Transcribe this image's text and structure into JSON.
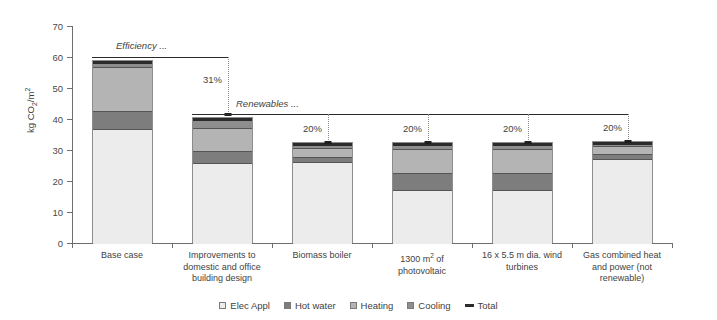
{
  "chart_data": {
    "type": "bar",
    "subtype": "stacked-bar",
    "title": "",
    "xlabel": "",
    "ylabel": "kg CO2/m2",
    "ylabel_parts": {
      "prefix": "kg CO",
      "sub": "2",
      "suffix": "/m",
      "sup": "2"
    },
    "ylim": [
      0,
      70
    ],
    "ytick_step": 10,
    "yticks": [
      "70",
      "60",
      "50",
      "40",
      "30",
      "20",
      "10",
      "0"
    ],
    "grid": false,
    "legend_position": "bottom",
    "categories": [
      "Base case",
      "Improvements to domestic and office building design",
      "Biomass boiler",
      "1300 m2 of photovoltaic",
      "16 x 5.5 m dia. wind turbines",
      "Gas combined heat and power (not renewable)"
    ],
    "series": [
      {
        "name": "Elec Appl",
        "color": "#ececec",
        "values": [
          37.0,
          26.0,
          26.5,
          17.5,
          17.5,
          27.5
        ]
      },
      {
        "name": "Hot water",
        "color": "#7d7d7d",
        "values": [
          6.0,
          4.0,
          1.5,
          5.5,
          5.5,
          1.5
        ]
      },
      {
        "name": "Heating",
        "color": "#b4b4b4",
        "values": [
          14.0,
          7.5,
          3.0,
          7.5,
          7.5,
          2.5
        ]
      },
      {
        "name": "Cooling",
        "color": "#8e8e8e",
        "values": [
          2.0,
          3.0,
          1.5,
          2.0,
          2.0,
          1.5
        ]
      },
      {
        "name": "Total",
        "color": "#2b2b2b",
        "values": [
          60.0,
          41.5,
          33.0,
          33.0,
          33.0,
          33.5
        ]
      }
    ],
    "annotations": [
      {
        "label": "Efficiency ...",
        "type": "bracket-label"
      },
      {
        "label": "Renewables ...",
        "type": "bracket-label"
      },
      {
        "label": "31%",
        "type": "reduction-callout",
        "at_category": 1
      },
      {
        "label": "20%",
        "type": "reduction-callout",
        "at_category": 2
      },
      {
        "label": "20%",
        "type": "reduction-callout",
        "at_category": 3
      },
      {
        "label": "20%",
        "type": "reduction-callout",
        "at_category": 4
      },
      {
        "label": "20%",
        "type": "reduction-callout",
        "at_category": 5
      }
    ]
  },
  "axis": {
    "y_title_prefix": "kg CO",
    "y_title_sub": "2",
    "y_title_suffix": "/m",
    "y_title_sup": "2",
    "ticks": [
      "70",
      "60",
      "50",
      "40",
      "30",
      "20",
      "10",
      "0"
    ]
  },
  "categories": [
    {
      "line1": "Base case",
      "line2": "",
      "line3": ""
    },
    {
      "line1": "Improvements to",
      "line2": "domestic and office",
      "line3": "building design"
    },
    {
      "line1": "Biomass boiler",
      "line2": "",
      "line3": ""
    },
    {
      "line1": "1300 m",
      "sup": "2",
      "line1b": " of",
      "line2": "photovoltaic",
      "line3": ""
    },
    {
      "line1": "16 x 5.5 m dia. wind",
      "line2": "turbines",
      "line3": ""
    },
    {
      "line1": "Gas combined heat",
      "line2": "and power (not",
      "line3": "renewable)"
    }
  ],
  "annotations": {
    "efficiency": "Efficiency ...",
    "renewables": "Renewables ...",
    "pct_bar2": "31%",
    "pct_bar3": "20%",
    "pct_bar4": "20%",
    "pct_bar5": "20%",
    "pct_bar6": "20%"
  },
  "legend": {
    "items": [
      {
        "label": "Elec Appl",
        "color": "#ececec",
        "kind": "swatch"
      },
      {
        "label": "Hot water",
        "color": "#7d7d7d",
        "kind": "swatch"
      },
      {
        "label": "Heating",
        "color": "#b4b4b4",
        "kind": "swatch"
      },
      {
        "label": "Cooling",
        "color": "#8e8e8e",
        "kind": "swatch"
      },
      {
        "label": "Total",
        "color": "#2b2b2b",
        "kind": "line"
      }
    ]
  }
}
